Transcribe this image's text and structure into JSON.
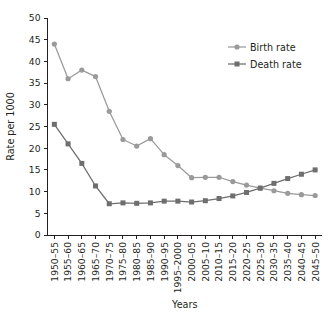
{
  "chart_data": {
    "type": "line",
    "title": "",
    "xlabel": "Years",
    "ylabel": "Rate per 1000",
    "ylim": [
      0,
      50
    ],
    "yticks": [
      0,
      5,
      10,
      15,
      20,
      25,
      30,
      35,
      40,
      45,
      50
    ],
    "grid": false,
    "legend_position": "top-right",
    "categories": [
      "1950–55",
      "1955–60",
      "1960–65",
      "1965–70",
      "1970–75",
      "1975–80",
      "1980–85",
      "1985–90",
      "1990–95",
      "1995–2000",
      "2000–05",
      "2005–10",
      "2010–15",
      "2015–20",
      "2020–25",
      "2025–30",
      "2030–35",
      "2035–40",
      "2040–45",
      "2045–50"
    ],
    "series": [
      {
        "name": "Birth rate",
        "color": "#9a9a9a",
        "marker": "circle",
        "values": [
          44.0,
          36.0,
          38.0,
          36.5,
          28.5,
          22.0,
          20.5,
          22.2,
          18.5,
          16.0,
          13.2,
          13.3,
          13.3,
          12.3,
          11.5,
          10.8,
          10.2,
          9.6,
          9.3,
          9.1
        ]
      },
      {
        "name": "Death rate",
        "color": "#6e6e6e",
        "marker": "square",
        "values": [
          25.5,
          21.0,
          16.5,
          11.3,
          7.2,
          7.4,
          7.3,
          7.4,
          7.8,
          7.8,
          7.6,
          7.9,
          8.4,
          9.0,
          9.8,
          10.8,
          11.9,
          13.0,
          14.0,
          15.0
        ]
      }
    ]
  },
  "colors": {
    "axis": "#231f20",
    "birth_rate": "#9a9a9a",
    "death_rate": "#6e6e6e",
    "background": "#ffffff"
  }
}
